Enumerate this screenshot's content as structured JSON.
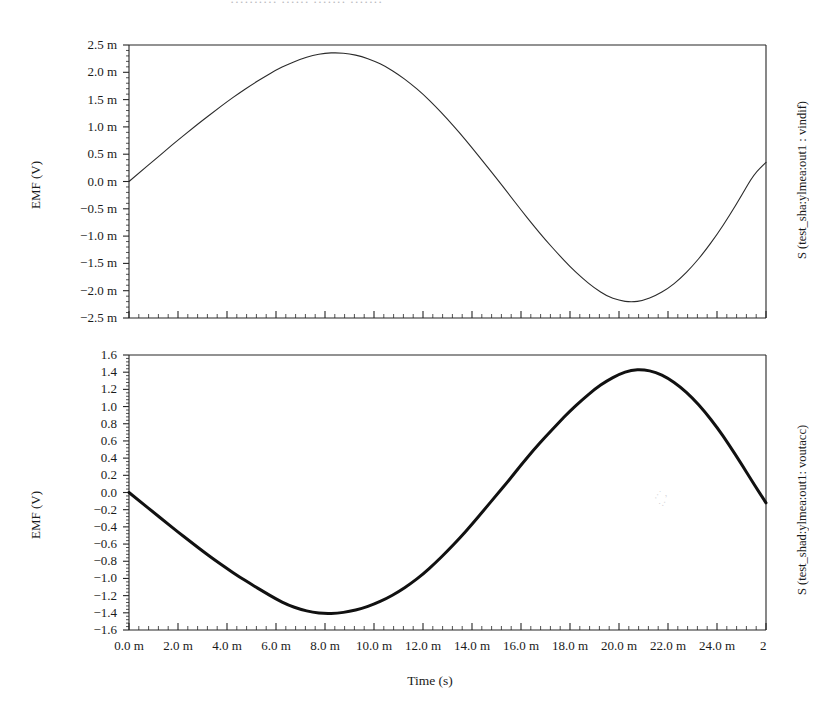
{
  "title_fragment": "··········   ······   ······· ·······",
  "axis_titles": {
    "x": "Time (s)",
    "y_top": "EMF (V)",
    "y_bottom": "EMF (V)",
    "right_top": "S (test_sha:ylmea:out1 : vindif)",
    "right_bottom": "S (test_shad:ylmea:out1: voutacc)"
  },
  "x_ticks": [
    "0.0 m",
    "2.0 m",
    "4.0 m",
    "6.0 m",
    "8.0 m",
    "10.0 m",
    "12.0 m",
    "14.0 m",
    "16.0 m",
    "18.0 m",
    "20.0 m",
    "22.0 m",
    "24.0 m",
    "2"
  ],
  "y_ticks_top": [
    "2.5 m",
    "2.0 m",
    "1.5 m",
    "1.0 m",
    "0.5 m",
    "0.0 m",
    "−0.5 m",
    "−1.0 m",
    "−1.5 m",
    "−2.0 m",
    "−2.5 m"
  ],
  "y_ticks_bottom": [
    "1.6",
    "1.4",
    "1.2",
    "1.0",
    "0.8",
    "0.6",
    "0.4",
    "0.2",
    "0.0",
    "−0.2",
    "−0.4",
    "−0.6",
    "−0.8",
    "−1.0",
    "−1.2",
    "−1.4",
    "−1.6"
  ],
  "colors": {
    "axis": "#262626",
    "trace_top": "#2b2b2b",
    "trace_bottom": "#111111",
    "background": "#ffffff",
    "title_ghost": "#b9b9bd"
  },
  "chart_data": [
    {
      "type": "line",
      "id": "vindif-waveform",
      "title": "",
      "xlabel": "Time (s)",
      "ylabel": "EMF (V)",
      "right_label": "S (test_sha:ylmea:out1 : vindif)",
      "grid": false,
      "legend": "none",
      "xlim": [
        0,
        26
      ],
      "ylim": [
        -0.0025,
        0.0025
      ],
      "x_tick_values": [
        0,
        2,
        4,
        6,
        8,
        10,
        12,
        14,
        16,
        18,
        20,
        22,
        24,
        26
      ],
      "x_tick_labels": [
        "0.0 m",
        "2.0 m",
        "4.0 m",
        "6.0 m",
        "8.0 m",
        "10.0 m",
        "12.0 m",
        "14.0 m",
        "16.0 m",
        "18.0 m",
        "20.0 m",
        "22.0 m",
        "24.0 m",
        "26.0 m"
      ],
      "x_tick_unit": "milli",
      "y_tick_values": [
        0.0025,
        0.002,
        0.0015,
        0.001,
        0.0005,
        0,
        -0.0005,
        -0.001,
        -0.0015,
        -0.002,
        -0.0025
      ],
      "y_tick_labels": [
        "2.5 m",
        "2.0 m",
        "1.5 m",
        "1.0 m",
        "0.5 m",
        "0.0 m",
        "−0.5 m",
        "−1.0 m",
        "−1.5 m",
        "−2.0 m",
        "−2.5 m"
      ],
      "minor_ticks_per_major": 5,
      "series": [
        {
          "name": "vindif",
          "line_width": 1.1,
          "color": "#2b2b2b",
          "x": [
            0,
            0.5,
            1,
            1.5,
            2,
            2.5,
            3,
            3.5,
            4,
            4.5,
            5,
            5.5,
            6,
            6.5,
            7,
            7.5,
            8,
            8.5,
            9,
            9.5,
            10,
            10.5,
            11,
            11.5,
            12,
            12.5,
            13,
            13.5,
            14,
            14.5,
            15,
            15.5,
            16,
            16.5,
            17,
            17.5,
            18,
            18.5,
            19,
            19.5,
            20,
            20.5,
            21,
            21.5,
            22,
            22.5,
            23,
            23.5,
            24,
            24.5,
            25,
            25.5,
            26
          ],
          "y": [
            0.0,
            0.00019,
            0.00038,
            0.00057,
            0.00076,
            0.00094,
            0.00112,
            0.00129,
            0.00146,
            0.00162,
            0.00177,
            0.00191,
            0.00204,
            0.00215,
            0.00224,
            0.00231,
            0.00235,
            0.00236,
            0.00234,
            0.00229,
            0.00221,
            0.0021,
            0.00196,
            0.00179,
            0.0016,
            0.00138,
            0.00114,
            0.00089,
            0.00062,
            0.00034,
            6e-05,
            -0.00023,
            -0.00052,
            -0.0008,
            -0.00107,
            -0.00132,
            -0.00156,
            -0.00177,
            -0.00195,
            -0.0021,
            -0.00218,
            -0.00221,
            -0.00218,
            -0.00209,
            -0.00196,
            -0.00178,
            -0.00155,
            -0.00128,
            -0.00097,
            -0.00063,
            -0.00026,
            0.00013,
            0.00035
          ]
        }
      ]
    },
    {
      "type": "line",
      "id": "voutacc-waveform",
      "title": "",
      "xlabel": "Time (s)",
      "ylabel": "EMF (V)",
      "right_label": "S (test_shad:ylmea:out1: voutacc)",
      "grid": false,
      "legend": "none",
      "xlim": [
        0,
        26
      ],
      "ylim": [
        -1.6,
        1.6
      ],
      "x_tick_values": [
        0,
        2,
        4,
        6,
        8,
        10,
        12,
        14,
        16,
        18,
        20,
        22,
        24,
        26
      ],
      "x_tick_labels": [
        "0.0 m",
        "2.0 m",
        "4.0 m",
        "6.0 m",
        "8.0 m",
        "10.0 m",
        "12.0 m",
        "14.0 m",
        "16.0 m",
        "18.0 m",
        "20.0 m",
        "22.0 m",
        "24.0 m",
        "26.0 m"
      ],
      "x_tick_unit": "milli",
      "y_tick_values": [
        1.6,
        1.4,
        1.2,
        1.0,
        0.8,
        0.6,
        0.4,
        0.2,
        0.0,
        -0.2,
        -0.4,
        -0.6,
        -0.8,
        -1.0,
        -1.2,
        -1.4,
        -1.6
      ],
      "y_tick_labels": [
        "1.6",
        "1.4",
        "1.2",
        "1.0",
        "0.8",
        "0.6",
        "0.4",
        "0.2",
        "0.0",
        "−0.2",
        "−0.4",
        "−0.6",
        "−0.8",
        "−1.0",
        "−1.2",
        "−1.4",
        "−1.6"
      ],
      "minor_ticks_per_major": 5,
      "series": [
        {
          "name": "voutacc",
          "line_width": 3.0,
          "color": "#111111",
          "x": [
            0,
            0.5,
            1,
            1.5,
            2,
            2.5,
            3,
            3.5,
            4,
            4.5,
            5,
            5.5,
            6,
            6.5,
            7,
            7.5,
            8,
            8.5,
            9,
            9.5,
            10,
            10.5,
            11,
            11.5,
            12,
            12.5,
            13,
            13.5,
            14,
            14.5,
            15,
            15.5,
            16,
            16.5,
            17,
            17.5,
            18,
            18.5,
            19,
            19.5,
            20,
            20.5,
            21,
            21.5,
            22,
            22.5,
            23,
            23.5,
            24,
            24.5,
            25,
            25.5,
            26
          ],
          "y": [
            0.0,
            -0.115,
            -0.23,
            -0.345,
            -0.46,
            -0.57,
            -0.68,
            -0.785,
            -0.885,
            -0.98,
            -1.07,
            -1.155,
            -1.24,
            -1.31,
            -1.36,
            -1.395,
            -1.41,
            -1.405,
            -1.385,
            -1.35,
            -1.3,
            -1.235,
            -1.155,
            -1.06,
            -0.95,
            -0.82,
            -0.68,
            -0.53,
            -0.37,
            -0.2,
            -0.03,
            0.14,
            0.32,
            0.49,
            0.65,
            0.8,
            0.95,
            1.08,
            1.2,
            1.3,
            1.375,
            1.425,
            1.43,
            1.4,
            1.33,
            1.23,
            1.1,
            0.94,
            0.76,
            0.55,
            0.33,
            0.1,
            -0.12
          ]
        }
      ]
    }
  ]
}
